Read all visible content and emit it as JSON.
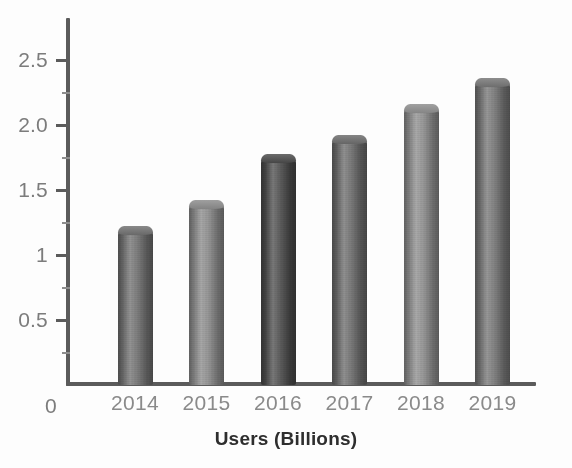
{
  "chart_data": {
    "type": "bar",
    "title": "",
    "xlabel": "Users (Billions)",
    "ylabel": "",
    "categories": [
      "2014",
      "2015",
      "2016",
      "2017",
      "2018",
      "2019"
    ],
    "values": [
      1.22,
      1.42,
      1.78,
      1.92,
      2.16,
      2.36
    ],
    "series": [
      {
        "name": "Users (Billions)",
        "values": [
          1.22,
          1.42,
          1.78,
          1.92,
          2.16,
          2.36
        ]
      }
    ],
    "ylim": [
      0,
      2.8
    ],
    "y_tick_labels": [
      "0",
      "0.5",
      "1",
      "1.5",
      "2.0",
      "2.5"
    ],
    "y_tick_values": [
      0,
      0.5,
      1,
      1.5,
      2.0,
      2.5
    ],
    "grid": false,
    "legend": false,
    "legend_position": "none",
    "bar_colors": [
      "#6f6f6f",
      "#8a8a8a",
      "#4a4a4a",
      "#6a6a6a",
      "#8c8c8c",
      "#747474"
    ],
    "axis_color": "#5b5b5b",
    "tick_label_color": "#7c7c7c",
    "category_label_color": "#8a8a8a",
    "title_color": "#2e2e2e",
    "background_color": "#fdfdfd"
  },
  "axis": {
    "x_title": "Users (Billions)",
    "y_labels": [
      {
        "text": "2.5",
        "value": 2.5
      },
      {
        "text": "2.0",
        "value": 2.0
      },
      {
        "text": "1.5",
        "value": 1.5
      },
      {
        "text": "1",
        "value": 1.0
      },
      {
        "text": "0.5",
        "value": 0.5
      },
      {
        "text": "0",
        "value": 0.0
      }
    ],
    "x_labels": [
      "2014",
      "2015",
      "2016",
      "2017",
      "2018",
      "2019"
    ]
  }
}
